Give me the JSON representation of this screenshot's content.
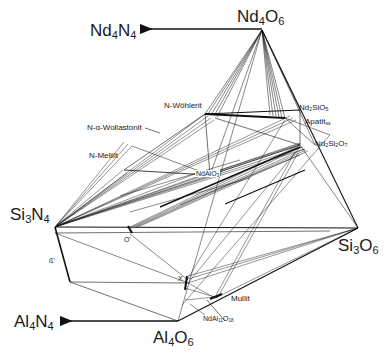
{
  "title_cutoff": "",
  "corners": {
    "nd4o6": {
      "base": "Nd",
      "s1": "4",
      "mid": "O",
      "s2": "6"
    },
    "nd4n4": {
      "base": "Nd",
      "s1": "4",
      "mid": "N",
      "s2": "4"
    },
    "si3n4": {
      "base": "Si",
      "s1": "3",
      "mid": "N",
      "s2": "4"
    },
    "si3o6": {
      "base": "Si",
      "s1": "3",
      "mid": "O",
      "s2": "6"
    },
    "al4n4": {
      "base": "Al",
      "s1": "4",
      "mid": "N",
      "s2": "4"
    },
    "al4o6": {
      "base": "Al",
      "s1": "4",
      "mid": "O",
      "s2": "6"
    }
  },
  "phases": {
    "n_wohlerit": "N-Wöhlerit",
    "n_alpha_wollastonit": "N-α-Wollastonit",
    "n_melilit": "N-Melilit",
    "ndalo3": {
      "base": "NdAlO",
      "s": "3"
    },
    "nd2sio5": {
      "a": "Nd",
      "s1": "2",
      "b": "SiO",
      "s2": "5"
    },
    "apatit": {
      "base": "Apatit",
      "s": "ss"
    },
    "nd2si2o7": {
      "a": "Nd",
      "s1": "2",
      "b": "Si",
      "s2": "2",
      "c": "O",
      "s3": "7"
    },
    "o_prime": "O'",
    "beta_prime": "ß'",
    "x_phase": "X",
    "mullit": "Mullit",
    "ndal11o18": {
      "a": "NdAl",
      "s1": "11",
      "b": "O",
      "s2": "18"
    }
  }
}
